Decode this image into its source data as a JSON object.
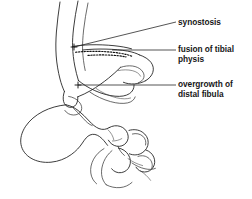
{
  "figure": {
    "background_color": "#ffffff",
    "line_color": "#1a1a1a",
    "width": 252,
    "height": 199
  },
  "callouts": [
    {
      "id": "synostosis",
      "label": "synostosis",
      "leader": {
        "x1": 74,
        "y1": 47,
        "x2": 176,
        "y2": 22
      },
      "anchor": {
        "x": 74,
        "y": 47
      }
    },
    {
      "id": "fusion",
      "label": "fusion of tibial\nphysis",
      "leader": {
        "x1": 112,
        "y1": 50,
        "x2": 176,
        "y2": 50
      },
      "anchor": {
        "x": 112,
        "y": 50
      }
    },
    {
      "id": "overgrowth",
      "label": "overgrowth of\ndistal fibula",
      "leader": {
        "x1": 78,
        "y1": 85,
        "x2": 176,
        "y2": 85
      },
      "anchor": {
        "x": 78,
        "y": 85
      }
    }
  ],
  "anatomy": {
    "parts": [
      "tibial-shaft",
      "fibular-shaft",
      "distal-tibia",
      "distal-fibula",
      "fused-physis",
      "talus",
      "calcaneus",
      "navicular",
      "cuboid",
      "cuneiforms",
      "metatarsal-bases"
    ]
  }
}
